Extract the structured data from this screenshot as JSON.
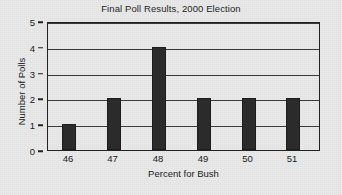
{
  "chart_data": {
    "type": "bar",
    "title": "Final Poll Results, 2000 Election",
    "xlabel": "Percent for Bush",
    "ylabel": "Number of Polls",
    "categories": [
      "46",
      "47",
      "48",
      "49",
      "50",
      "51"
    ],
    "values": [
      1,
      2,
      4,
      2,
      2,
      2
    ],
    "ylim": [
      0,
      5
    ],
    "yticks": [
      "0",
      "1",
      "2",
      "3",
      "4",
      "5"
    ],
    "grid": "horizontal",
    "legend": "none",
    "bar_color": "#2b2b2b",
    "frame_color": "#222222",
    "background_color": "#e9e9e9"
  }
}
